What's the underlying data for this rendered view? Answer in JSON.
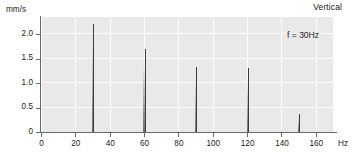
{
  "chart_data": {
    "type": "bar",
    "title": "Vertical",
    "xlabel": "Hz",
    "ylabel": "mm/s",
    "xlim": [
      0,
      170
    ],
    "ylim": [
      0,
      2.35
    ],
    "grid": true,
    "legend": "none",
    "annotations": [
      {
        "text": "f = 30Hz",
        "position": "top-right-inside"
      }
    ],
    "x_ticks": [
      0,
      20,
      40,
      60,
      80,
      100,
      120,
      140,
      160
    ],
    "x_tick_labels": [
      "0",
      "20",
      "40",
      "60",
      "80",
      "100",
      "120",
      "140",
      "160"
    ],
    "y_ticks": [
      0,
      0.5,
      1.0,
      1.5,
      2.0
    ],
    "y_tick_labels": [
      "0",
      "0.5",
      "1.0",
      "1.5",
      "2.0"
    ],
    "x": [
      30,
      60,
      90,
      120,
      150
    ],
    "values": [
      2.2,
      1.7,
      1.33,
      1.31,
      0.37
    ],
    "point_labels": [
      "30 Hz",
      "60 Hz",
      "90 Hz",
      "120 Hz",
      "150 Hz"
    ],
    "series_name": "Vertical velocity spectrum",
    "colors": {
      "plot_background": "#e9e9e9",
      "gridline": "#fbfbfb",
      "axis": "#6a6a6a",
      "spike": "#3c3c3c",
      "text": "#1a1a1a",
      "page_background": "#ffffff"
    }
  }
}
